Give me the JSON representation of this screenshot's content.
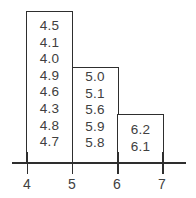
{
  "diagram": {
    "type": "histogram-stem-leaf-boxes",
    "bins": [
      {
        "range": [
          4,
          5
        ],
        "values": [
          "4.5",
          "4.1",
          "4.0",
          "4.9",
          "4.6",
          "4.3",
          "4.8",
          "4.7"
        ]
      },
      {
        "range": [
          5,
          6
        ],
        "values": [
          "5.0",
          "5.1",
          "5.6",
          "5.9",
          "5.8"
        ]
      },
      {
        "range": [
          6,
          7
        ],
        "values": [
          "6.2",
          "6.1"
        ]
      }
    ],
    "axis": {
      "ticks": [
        "4",
        "5",
        "6",
        "7"
      ]
    }
  }
}
